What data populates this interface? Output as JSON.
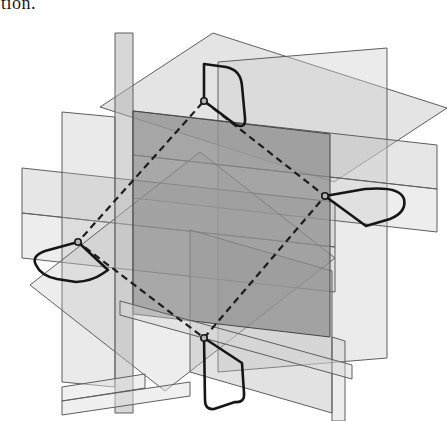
{
  "page": {
    "cropped_text": "tion."
  },
  "figure": {
    "width": 447,
    "height": 421,
    "background": "#ffffff",
    "plane_stroke": "#5e5e5e",
    "plane_stroke_width": 1,
    "central_plane_stroke": "#454545",
    "profile_color": "#161616",
    "profile_width": 2.6,
    "dash_color": "#1d1d1d",
    "dash_width": 2.2,
    "dash_pattern": "7 4.5",
    "vertex_fill": "#b5b5b5",
    "vertex_stroke": "#161616",
    "vertex_radius": 3.2,
    "planes": [
      {
        "name": "work-plane-upper-slanted",
        "points": "100,107 213,33 447,108 334,182",
        "fill": "#c4c4c4",
        "opacity": 0.45
      },
      {
        "name": "work-plane-tall-right",
        "points": "218,62 387,48 387,358 218,372",
        "fill": "#d0d0d0",
        "opacity": 0.42
      },
      {
        "name": "work-plane-band-right-upper",
        "points": "133,111 437,145 437,189 133,155",
        "fill": "#c0c0c0",
        "opacity": 0.4
      },
      {
        "name": "work-plane-band-right-lower",
        "points": "133,155 437,189 437,232 133,198",
        "fill": "#cacaca",
        "opacity": 0.35
      },
      {
        "name": "work-plane-band-left-upper",
        "points": "22,168 335,202 335,247 22,213",
        "fill": "#c0c0c0",
        "opacity": 0.4
      },
      {
        "name": "work-plane-band-left-lower",
        "points": "22,213 335,247 335,292 22,258",
        "fill": "#cacaca",
        "opacity": 0.35
      },
      {
        "name": "work-plane-tall-left",
        "points": "62,112 115,117 115,387 62,382",
        "fill": "#bbbbbb",
        "opacity": 0.3
      },
      {
        "name": "work-plane-diagonal",
        "points": "30,285 200,152 335,258 165,391",
        "fill": "#bdbdbd",
        "opacity": 0.28
      },
      {
        "name": "work-plane-column-center",
        "points": "115,33 133,33 133,413 115,413",
        "fill": "#b0b0b0",
        "opacity": 0.5
      },
      {
        "name": "work-plane-lower-right",
        "points": "190,230 332,271 332,413 190,372",
        "fill": "#b6b6b6",
        "opacity": 0.4
      },
      {
        "name": "work-plane-column-right",
        "points": "332,337 345,341 345,421 332,421",
        "fill": "#c2c2c2",
        "opacity": 0.3
      },
      {
        "name": "work-plane-central-dark",
        "points": "133,111 330,134 330,337 133,314",
        "fill": "#8d8d8d",
        "opacity": 0.72,
        "dark": true
      },
      {
        "name": "work-plane-strip-lower",
        "points": "120,301 352,365 352,379 120,315",
        "fill": "#d8d8d8",
        "opacity": 0.45
      },
      {
        "name": "work-plane-step-upper",
        "points": "62,387 145,374 145,388 62,401",
        "fill": "#e2e2e2",
        "opacity": 0.5
      },
      {
        "name": "work-plane-step-lower",
        "points": "62,401 190,382 190,396 62,415",
        "fill": "#e2e2e2",
        "opacity": 0.5
      }
    ],
    "profiles": [
      {
        "name": "sketch-profile-top",
        "path": "M 204,101 L 204,64 L 226,67 Q 241,70 242,86 L 245,118 Q 246,129 236,125 Z"
      },
      {
        "name": "sketch-profile-right",
        "path": "M 325,196 L 365,189 Q 400,186 404,199 Q 407,212 390,219 L 366,226 Z"
      },
      {
        "name": "sketch-profile-bottom",
        "path": "M 204,338 L 242,363 L 244,393 Q 245,403 235,402 L 214,409 Q 205,410 205,400 Z"
      },
      {
        "name": "sketch-profile-left",
        "path": "M 78,242 L 45,251 Q 31,256 36,265 Q 41,276 57,279 L 76,282 Q 92,281 102,274 L 108,270 Z"
      }
    ],
    "dashed_path": {
      "name": "sweep-path-dashed",
      "points": "204,101 325,196 204,338 78,242"
    },
    "vertices": [
      {
        "name": "path-vertex-top",
        "cx": 204,
        "cy": 101
      },
      {
        "name": "path-vertex-right",
        "cx": 325,
        "cy": 196
      },
      {
        "name": "path-vertex-bottom",
        "cx": 204,
        "cy": 338
      },
      {
        "name": "path-vertex-left",
        "cx": 78,
        "cy": 242
      }
    ]
  }
}
